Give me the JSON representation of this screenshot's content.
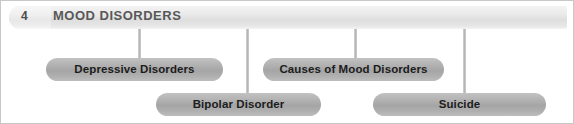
{
  "header": {
    "number": "4",
    "title": "MOOD DISORDERS",
    "bar_color": "#e6e6e6",
    "text_color": "#585858"
  },
  "diagram": {
    "connector_color": "#b4b4b4",
    "node_color": "#b0b0b0",
    "node_text_color": "#1c1c1c",
    "nodes": [
      {
        "label": "Depressive Disorders",
        "x": 45,
        "y": 57,
        "width": 177,
        "row": 1
      },
      {
        "label": "Causes of Mood Disorders",
        "x": 262,
        "y": 57,
        "width": 181,
        "row": 1
      },
      {
        "label": "Bipolar Disorder",
        "x": 155,
        "y": 92,
        "width": 165,
        "row": 2
      },
      {
        "label": "Suicide",
        "x": 372,
        "y": 92,
        "width": 173,
        "row": 2
      }
    ],
    "connectors": [
      {
        "x": 137,
        "y": 28,
        "height": 29,
        "target": "Depressive Disorders"
      },
      {
        "x": 245,
        "y": 28,
        "height": 64,
        "target": "Bipolar Disorder"
      },
      {
        "x": 353,
        "y": 28,
        "height": 29,
        "target": "Causes of Mood Disorders"
      },
      {
        "x": 462,
        "y": 28,
        "height": 64,
        "target": "Suicide"
      }
    ]
  }
}
